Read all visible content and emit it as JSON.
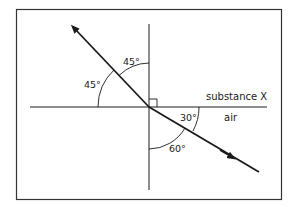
{
  "diagram": {
    "regions": {
      "upper": "substance X",
      "lower": "air"
    },
    "angles": {
      "upper_ray_from_normal": "45°",
      "upper_ray_from_surface": "45°",
      "lower_ray_from_surface": "30°",
      "lower_ray_from_normal": "60°"
    },
    "right_angle_marker": true,
    "colors": {
      "line": "#1a1a1a",
      "frame": "#333333",
      "background": "#ffffff"
    }
  }
}
